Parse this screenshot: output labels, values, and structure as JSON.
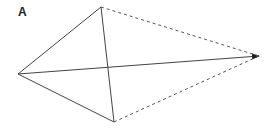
{
  "panel": {
    "label": "A"
  },
  "diagram": {
    "vertices": {
      "left": {
        "x": 18,
        "y": 74
      },
      "top": {
        "x": 101,
        "y": 7
      },
      "bottom": {
        "x": 114,
        "y": 122
      },
      "right": {
        "x": 259,
        "y": 56
      }
    },
    "edges": [
      {
        "from": "left",
        "to": "top",
        "style": "solid"
      },
      {
        "from": "left",
        "to": "bottom",
        "style": "solid"
      },
      {
        "from": "top",
        "to": "bottom",
        "style": "solid"
      },
      {
        "from": "left",
        "to": "right",
        "style": "solid-arrow"
      },
      {
        "from": "top",
        "to": "right",
        "style": "dashed"
      },
      {
        "from": "bottom",
        "to": "right",
        "style": "dashed"
      }
    ],
    "colors": {
      "line": "#444444",
      "dashed": "#555555",
      "arrow": "#222222"
    }
  }
}
